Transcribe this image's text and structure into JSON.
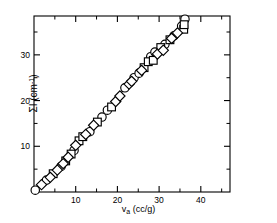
{
  "chart_data": {
    "type": "scatter",
    "title": "",
    "xlabel": "v_a (cc/g)",
    "xlabel_parts": {
      "base": "v",
      "sub": "a",
      "unit": " (cc/g)"
    },
    "ylabel": "ΣI (cm⁻¹)",
    "ylabel_parts": {
      "base": "ΣI (cm",
      "sup": "-1",
      "tail": ")"
    },
    "xlim": [
      0,
      47
    ],
    "ylim": [
      0,
      38.5
    ],
    "xticks": [
      10,
      20,
      30,
      40
    ],
    "xticklabels": [
      "10",
      "20",
      "30",
      "40"
    ],
    "xminorticks": [
      5,
      15,
      25,
      35,
      45
    ],
    "yticks": [
      10,
      20,
      30
    ],
    "yticklabels": [
      "10",
      "20",
      "30"
    ],
    "yminorticks": [
      5,
      15,
      25,
      35
    ],
    "grid": false,
    "legend": false,
    "frame": "box",
    "tick_direction": "in",
    "line_color": "#000000",
    "marker_edge_color": "#000000",
    "marker_face_color": "#ffffff",
    "series": [
      {
        "name": "circles",
        "marker": "circle",
        "points": [
          [
            0.3,
            0.4
          ],
          [
            3.0,
            2.6
          ],
          [
            6.5,
            5.6
          ],
          [
            9.6,
            9.1
          ],
          [
            13.4,
            13.2
          ],
          [
            16.3,
            16.4
          ],
          [
            17.6,
            17.9
          ],
          [
            21.8,
            22.8
          ],
          [
            24.0,
            25.0
          ],
          [
            25.2,
            26.0
          ],
          [
            28.0,
            29.6
          ],
          [
            29.0,
            30.6
          ],
          [
            31.4,
            32.3
          ],
          [
            33.6,
            34.2
          ],
          [
            35.4,
            36.3
          ],
          [
            36.2,
            37.8
          ]
        ]
      },
      {
        "name": "squares",
        "marker": "square",
        "points": [
          [
            4.6,
            4.0
          ],
          [
            7.6,
            6.8
          ],
          [
            8.9,
            8.3
          ],
          [
            10.8,
            11.2
          ],
          [
            11.7,
            12.1
          ],
          [
            15.2,
            15.3
          ],
          [
            18.6,
            18.6
          ],
          [
            26.4,
            27.2
          ],
          [
            27.4,
            28.5
          ],
          [
            28.6,
            28.8
          ],
          [
            30.4,
            31.6
          ],
          [
            32.6,
            33.3
          ],
          [
            35.9,
            35.6
          ],
          [
            36.0,
            36.6
          ]
        ]
      },
      {
        "name": "diamonds",
        "marker": "diamond",
        "points": [
          [
            1.8,
            1.6
          ],
          [
            3.9,
            3.2
          ],
          [
            5.6,
            4.8
          ],
          [
            7.0,
            6.2
          ],
          [
            8.2,
            7.6
          ],
          [
            10.0,
            10.2
          ],
          [
            12.4,
            12.6
          ],
          [
            14.3,
            14.6
          ],
          [
            19.6,
            19.8
          ],
          [
            20.6,
            21.0
          ],
          [
            22.8,
            23.6
          ],
          [
            23.4,
            24.2
          ],
          [
            25.8,
            26.6
          ],
          [
            29.6,
            30.2
          ],
          [
            31.0,
            31.0
          ],
          [
            33.0,
            33.6
          ],
          [
            34.4,
            34.8
          ]
        ]
      }
    ],
    "trendline": {
      "name": "connecting-curve",
      "points": [
        [
          0.3,
          0.4
        ],
        [
          3.0,
          2.6
        ],
        [
          6.0,
          5.2
        ],
        [
          9.0,
          8.6
        ],
        [
          12.0,
          12.0
        ],
        [
          15.0,
          15.2
        ],
        [
          18.0,
          18.3
        ],
        [
          21.0,
          21.8
        ],
        [
          24.0,
          25.0
        ],
        [
          27.0,
          28.2
        ],
        [
          30.0,
          31.1
        ],
        [
          33.0,
          33.8
        ],
        [
          35.5,
          36.2
        ],
        [
          36.3,
          37.9
        ]
      ]
    }
  }
}
